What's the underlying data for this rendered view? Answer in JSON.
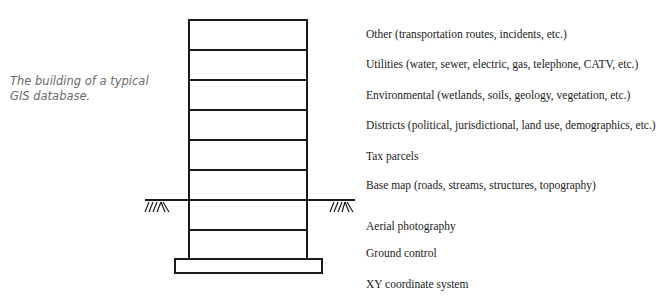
{
  "caption": "The building of a typical GIS database.",
  "layers": [
    {
      "label": "Other (transportation routes, incidents, etc.)",
      "top": 27
    },
    {
      "label": "Utilities (water, sewer, electric, gas, telephone, CATV, etc.)",
      "top": 57
    },
    {
      "label": "Environmental (wetlands, soils, geology, vegetation, etc.)",
      "top": 88
    },
    {
      "label": "Districts (political, jurisdictional, land use, demographics, etc.)",
      "top": 118
    },
    {
      "label": "Tax parcels",
      "top": 149
    },
    {
      "label": "Base map (roads, streams, structures, topography)",
      "top": 178
    },
    {
      "label": "Aerial photography",
      "top": 219
    },
    {
      "label": "Ground control",
      "top": 246
    },
    {
      "label": "XY coordinate system",
      "top": 277
    }
  ],
  "colors": {
    "line": "#1a1a1a",
    "caption": "#6b6b6b"
  }
}
